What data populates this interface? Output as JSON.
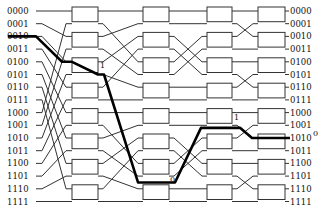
{
  "diagram": {
    "title": "",
    "type": "multistage-interconnection-network",
    "left_labels": [
      "0000",
      "0001",
      "0010",
      "0011",
      "0100",
      "0101",
      "0110",
      "0111",
      "1000",
      "1001",
      "1010",
      "1011",
      "1100",
      "1101",
      "1110",
      "1111"
    ],
    "right_labels": [
      "0000",
      "0001",
      "0010",
      "0011",
      "0100",
      "0101",
      "0110",
      "0111",
      "1000",
      "1001",
      "1010",
      "1011",
      "1100",
      "1101",
      "1110",
      "1111"
    ],
    "stages": 4,
    "switches_per_stage": 8,
    "highlighted_route": {
      "source": "0010",
      "destination": "1010",
      "bit_marks": [
        "1",
        "0",
        "1",
        "0"
      ]
    },
    "colors": {
      "wire": "#333333",
      "route": "#000000",
      "background": "#ffffff"
    }
  }
}
